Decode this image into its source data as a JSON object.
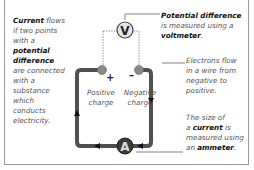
{
  "left_text": {
    "bold1": "Current",
    "line1_rest": " flows",
    "line2": "if two points",
    "line3": "with a",
    "bold2": "potential",
    "bold3": "difference",
    "line6": "are connected",
    "line7": "with a",
    "line8": "substance",
    "line9": "which",
    "line10": "conducts",
    "line11": "electricity."
  },
  "top_right_text": {
    "bold1": "Potential difference",
    "line2": "is measured using a",
    "bold3": "voltmeter",
    "end3": "."
  },
  "middle_right_text": {
    "line1": "Electrons flow",
    "line2": "in a wire from",
    "line3": "negative to",
    "line4": "positive."
  },
  "bottom_right_text": {
    "line1": "The size of",
    "pre2": "a ",
    "bold2": "current",
    "post2": " is",
    "line3": "measured using",
    "pre4": "an ",
    "bold4": "ammeter",
    "end4": "."
  },
  "terminals": {
    "positive_sign": "+",
    "negative_sign": "–",
    "positive_label_1": "Positive",
    "positive_label_2": "charge",
    "negative_label_1": "Negative",
    "negative_label_2": "charge"
  },
  "meters": {
    "voltmeter_symbol": "V",
    "ammeter_symbol": "A"
  },
  "colors": {
    "wire": "#505050",
    "terminal": "#8a8a8a",
    "voltmeter_fill": "#e4e4e4",
    "ammeter_fill": "#3a3a3a",
    "border": "#9a9a9a"
  }
}
